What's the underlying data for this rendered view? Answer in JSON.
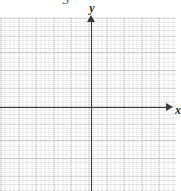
{
  "figure": {
    "type": "blank-cartesian-grid",
    "top_label": "3",
    "background_color": "#ffffff",
    "axis_color": "#3a3a3a",
    "major_grid_color": "#969696",
    "minor_grid_color": "#afafaf"
  },
  "axes": {
    "x": {
      "label": "x",
      "arrow": "arrow-right",
      "origin_px": 91,
      "line_y_px": 107
    },
    "y": {
      "label": "y",
      "arrow": "arrow-up",
      "origin_px": 107,
      "line_x_px": 91
    }
  },
  "chart_data": {
    "type": "scatter",
    "title": "",
    "subtitle": "",
    "xlabel": "x",
    "ylabel": "y",
    "series": [
      {
        "name": "",
        "x": [],
        "y": []
      }
    ],
    "annotations": [
      {
        "text": "3",
        "position": "top-center",
        "clipped": true
      }
    ],
    "xlim": [
      -5,
      5
    ],
    "ylim": [
      -5,
      5
    ],
    "x_ticks": [],
    "y_ticks": [],
    "grid": true,
    "grid_major_spacing": 1,
    "grid_minor_divisions": 4,
    "legend": false,
    "legend_position": "none",
    "note": "Empty coordinate plane / graph paper with no plotted data points or curves"
  }
}
